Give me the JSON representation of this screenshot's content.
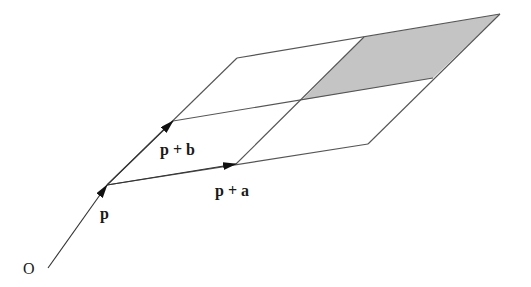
{
  "diagram": {
    "labels": {
      "origin": "O",
      "p": "p",
      "p_plus_a": "p + a",
      "p_plus_b": "p + b"
    },
    "points": {
      "O": [
        48,
        268
      ],
      "p": [
        107,
        185
      ],
      "p_plus_a": [
        236,
        164
      ],
      "p_plus_2a": [
        368,
        144
      ],
      "p_plus_b": [
        173,
        121
      ],
      "p_plus_a_plus_b": [
        302,
        100
      ],
      "p_plus_2a_plus_b": [
        433,
        78
      ],
      "p_plus_2b": [
        237,
        58
      ],
      "p_plus_a_plus_2b": [
        364,
        37
      ],
      "p_plus_2a_plus_2b": [
        500,
        14
      ]
    },
    "shaded_cell": "p+a+b to p+2a+2b",
    "colors": {
      "line": "#555555",
      "arrow": "#111111",
      "shade": "#c4c4c4",
      "text": "#1a1a1a"
    }
  }
}
